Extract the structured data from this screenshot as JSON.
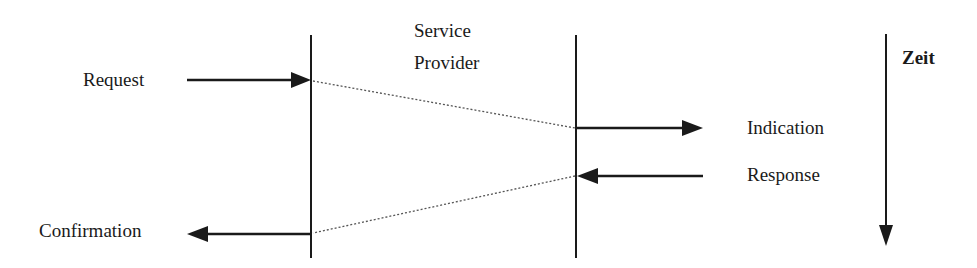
{
  "diagram": {
    "type": "sequence-diagram",
    "participants": {
      "service_provider": {
        "label_line1": "Service",
        "label_line2": "Provider"
      }
    },
    "primitives": {
      "request": "Request",
      "indication": "Indication",
      "response": "Response",
      "confirmation": "Confirmation"
    },
    "time_axis": {
      "label": "Zeit",
      "direction": "down"
    },
    "colors": {
      "line": "#1a1a1a",
      "dotted": "#555555",
      "background": "#ffffff"
    }
  }
}
